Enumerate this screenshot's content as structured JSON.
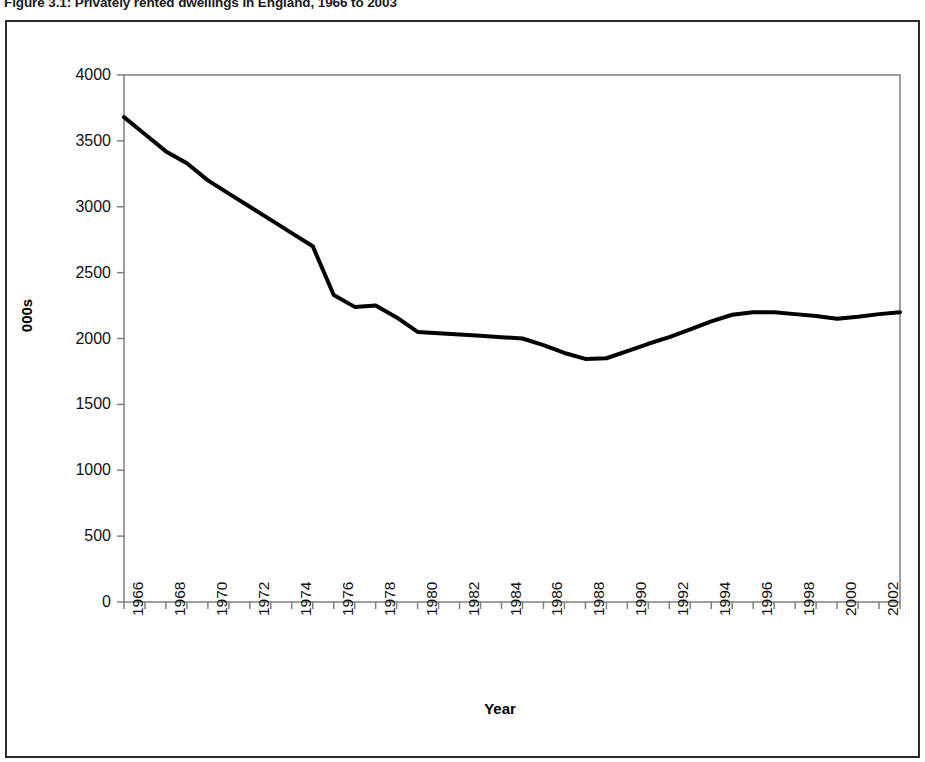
{
  "figure": {
    "title": "Figure 3.1: Privately rented dwellings in England, 1966 to 2003",
    "border_color": "#2b2b2b",
    "background": "#ffffff"
  },
  "chart_data": {
    "type": "line",
    "title": "Figure 3.1: Privately rented dwellings in England, 1966 to 2003",
    "xlabel": "Year",
    "ylabel": "000s",
    "ylim": [
      0,
      4000
    ],
    "xlim": [
      1966,
      2003
    ],
    "y_ticks": [
      0,
      500,
      1000,
      1500,
      2000,
      2500,
      3000,
      3500,
      4000
    ],
    "y_tick_labels": [
      "0",
      "500",
      "1000",
      "1500",
      "2000",
      "2500",
      "3000",
      "3500",
      "4000"
    ],
    "x_tick_labels": [
      "1966",
      "1967",
      "1968",
      "1969",
      "1970",
      "1971",
      "1972",
      "1973",
      "1974",
      "1975",
      "1976",
      "1977",
      "1978",
      "1979",
      "1980",
      "1981",
      "1982",
      "1983",
      "1984",
      "1985",
      "1986",
      "1987",
      "1988",
      "1989",
      "1990",
      "1991",
      "1992",
      "1993",
      "1994",
      "1995",
      "1996",
      "1997",
      "1998",
      "1999",
      "2000",
      "2001",
      "2002",
      "2003"
    ],
    "x_visible_tick_labels": [
      "1966",
      "1968",
      "1970",
      "1972",
      "1974",
      "1976",
      "1978",
      "1980",
      "1982",
      "1984",
      "1986",
      "1988",
      "1990",
      "1992",
      "1994",
      "1996",
      "1998",
      "2000",
      "2002"
    ],
    "grid": false,
    "legend": "none",
    "line_color": "#000000",
    "line_width": 4,
    "x": [
      1966,
      1967,
      1968,
      1969,
      1970,
      1971,
      1972,
      1973,
      1974,
      1975,
      1976,
      1977,
      1978,
      1979,
      1980,
      1981,
      1982,
      1983,
      1984,
      1985,
      1986,
      1987,
      1988,
      1989,
      1990,
      1991,
      1992,
      1993,
      1994,
      1995,
      1996,
      1997,
      1998,
      1999,
      2000,
      2001,
      2002,
      2003
    ],
    "values": [
      3680,
      3550,
      3420,
      3330,
      3200,
      3100,
      3000,
      2900,
      2800,
      2700,
      2330,
      2240,
      2250,
      2160,
      2050,
      2040,
      2030,
      2020,
      2010,
      2000,
      1950,
      1890,
      1845,
      1850,
      1905,
      1960,
      2010,
      2070,
      2130,
      2180,
      2200,
      2200,
      2185,
      2170,
      2150,
      2165,
      2185,
      2200
    ],
    "series": [
      {
        "name": "Privately rented dwellings",
        "values": [
          3680,
          3550,
          3420,
          3330,
          3200,
          3100,
          3000,
          2900,
          2800,
          2700,
          2330,
          2240,
          2250,
          2160,
          2050,
          2040,
          2030,
          2020,
          2010,
          2000,
          1950,
          1890,
          1845,
          1850,
          1905,
          1960,
          2010,
          2070,
          2130,
          2180,
          2200,
          2200,
          2185,
          2170,
          2150,
          2165,
          2185,
          2200
        ]
      }
    ]
  }
}
